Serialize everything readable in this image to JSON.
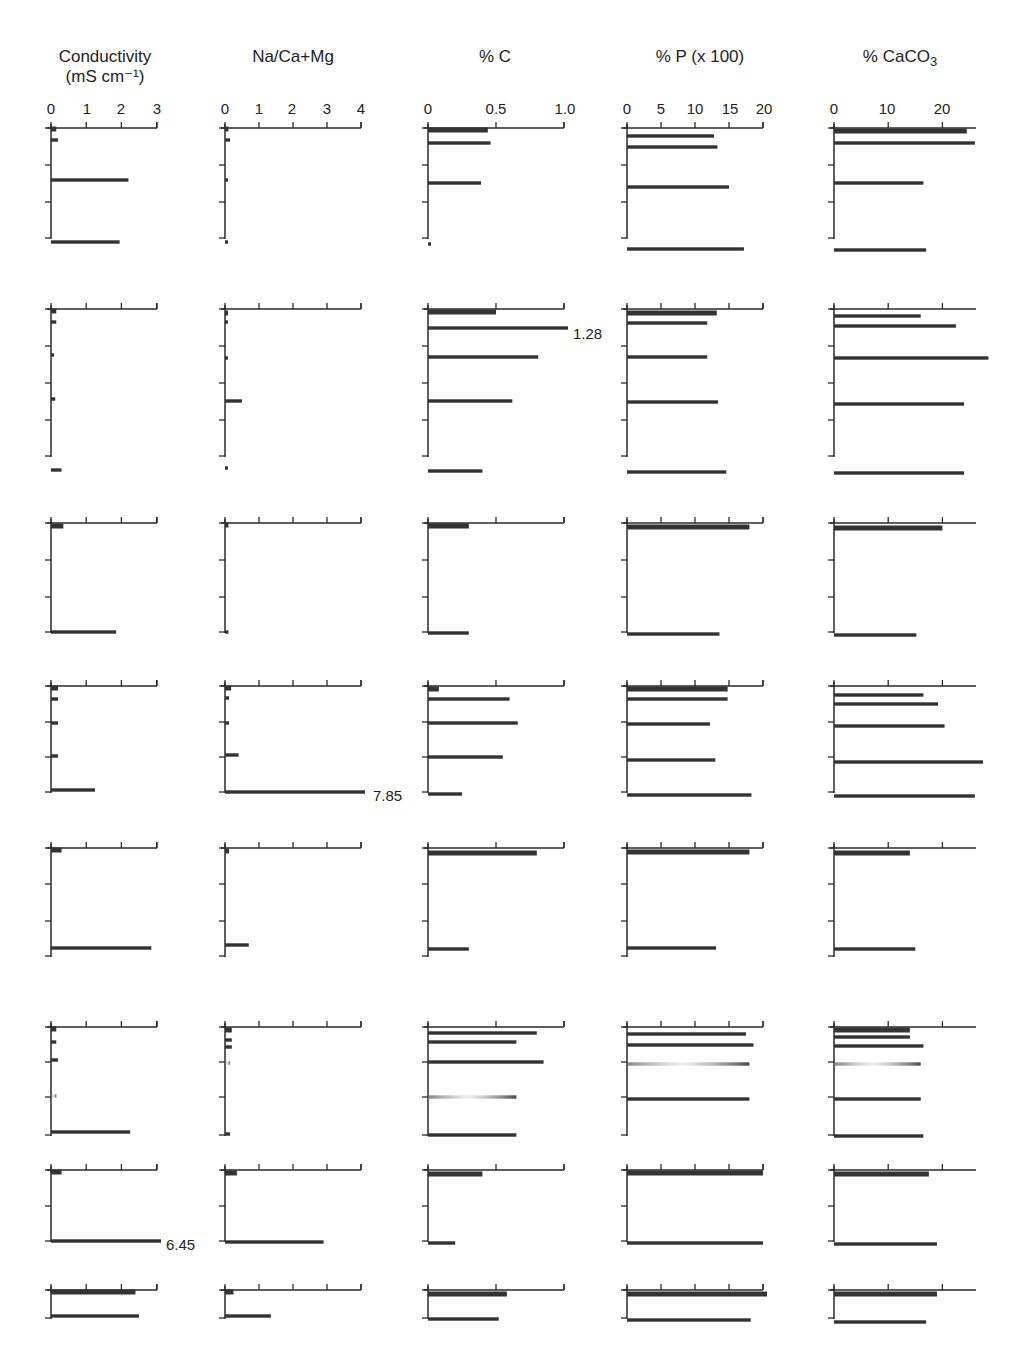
{
  "chart_data": {
    "type": "bar",
    "orientation": "horizontal",
    "title": "",
    "columns": [
      {
        "key": "cond",
        "label": "Conductivity",
        "unit_label": "(mS cm⁻¹)",
        "ticks": [
          "0",
          "1",
          "2",
          "3"
        ],
        "tick_values": [
          0,
          1,
          2,
          3
        ],
        "xlim": [
          0,
          3
        ]
      },
      {
        "key": "na",
        "label": "Na/Ca+Mg",
        "unit_label": "",
        "ticks": [
          "0",
          "1",
          "2",
          "3",
          "4"
        ],
        "tick_values": [
          0,
          1,
          2,
          3,
          4
        ],
        "xlim": [
          0,
          4
        ]
      },
      {
        "key": "c",
        "label": "% C",
        "unit_label": "",
        "ticks": [
          "0",
          "0.5",
          "1.0"
        ],
        "tick_values": [
          0,
          0.5,
          1.0
        ],
        "xlim": [
          0,
          1.0
        ]
      },
      {
        "key": "p",
        "label": "% P (x 100)",
        "unit_label": "",
        "ticks": [
          "0",
          "5",
          "10",
          "15",
          "20"
        ],
        "tick_values": [
          0,
          5,
          10,
          15,
          20
        ],
        "xlim": [
          0,
          20
        ]
      },
      {
        "key": "caco3",
        "label": "% CaCO",
        "label_sub": "3",
        "unit_label": "",
        "ticks": [
          "0",
          "10",
          "20"
        ],
        "tick_values": [
          0,
          10,
          20
        ],
        "xlim": [
          0,
          26
        ]
      }
    ],
    "profiles": [
      {
        "name": "Profile 1",
        "depth_ticks": 4,
        "series": {
          "cond": [
            0.15,
            0.2,
            2.2,
            1.95
          ],
          "na": [
            0.1,
            0.15,
            0.08,
            0.08
          ],
          "c": [
            0.44,
            0.46,
            0.39,
            0.02
          ],
          "p": [
            12.8,
            13.3,
            15.0,
            17.2
          ],
          "caco3": [
            24.5,
            26.0,
            16.5,
            17.0
          ]
        },
        "annotations": []
      },
      {
        "name": "Profile 2",
        "depth_ticks": 6,
        "series": {
          "cond": [
            0.15,
            0.15,
            0.08,
            0.12,
            0.3
          ],
          "na": [
            0.02,
            0.02,
            0.02,
            0.5,
            0.08
          ],
          "c": [
            0.5,
            1.28,
            0.81,
            0.62,
            0.4
          ],
          "p": [
            13.2,
            11.8,
            11.8,
            13.4,
            14.6
          ],
          "caco3": [
            16.0,
            22.5,
            28.5,
            24.0,
            24.0
          ]
        },
        "annotations": [
          {
            "column": "c",
            "bar_index": 1,
            "text": "1.28"
          }
        ]
      },
      {
        "name": "Profile 3",
        "depth_ticks": 3,
        "series": {
          "cond": [
            0.35,
            1.85
          ],
          "na": [
            0.1,
            0.1
          ],
          "c": [
            0.3,
            0.3
          ],
          "p": [
            18.0,
            13.6
          ],
          "caco3": [
            20.0,
            15.2
          ]
        },
        "annotations": []
      },
      {
        "name": "Profile 4",
        "depth_ticks": 4,
        "series": {
          "cond": [
            0.2,
            0.2,
            0.2,
            0.2,
            1.25
          ],
          "na": [
            0.18,
            0.12,
            0.12,
            0.4,
            7.85
          ],
          "c": [
            0.08,
            0.6,
            0.66,
            0.55,
            0.25
          ],
          "p": [
            14.8,
            14.8,
            12.2,
            13.0,
            18.3
          ],
          "caco3": [
            16.5,
            19.2,
            20.4,
            27.5,
            26.0
          ]
        },
        "annotations": [
          {
            "column": "na",
            "bar_index": 4,
            "text": "7.85"
          }
        ]
      },
      {
        "name": "Profile 5",
        "depth_ticks": 3,
        "series": {
          "cond": [
            0.3,
            2.85
          ],
          "na": [
            0.12,
            0.7
          ],
          "c": [
            0.8,
            0.3
          ],
          "p": [
            18.0,
            13.1
          ],
          "caco3": [
            14.0,
            15.0
          ]
        },
        "annotations": []
      },
      {
        "name": "Profile 6",
        "depth_ticks": 3,
        "series": {
          "cond": [
            0.15,
            0.15,
            0.2,
            0.15,
            2.25
          ],
          "na": [
            0.2,
            0.2,
            0.2,
            0.15,
            0.15
          ],
          "c": [
            0.8,
            0.65,
            0.85,
            0.65,
            0.65
          ],
          "p": [
            17.5,
            18.6,
            18.0,
            18.0
          ],
          "caco3": [
            14.0,
            14.0,
            16.5,
            16.0,
            16.0,
            16.5
          ]
        },
        "faded_bars": [
          {
            "column": "cond",
            "bar_index": 3
          },
          {
            "column": "na",
            "bar_index": 3
          },
          {
            "column": "c",
            "bar_index": 3
          },
          {
            "column": "p",
            "bar_index": 2
          },
          {
            "column": "caco3",
            "bar_index": 3
          }
        ],
        "annotations": []
      },
      {
        "name": "Profile 7",
        "depth_ticks": 2,
        "series": {
          "cond": [
            0.3,
            6.45
          ],
          "na": [
            0.35,
            2.9
          ],
          "c": [
            0.4,
            0.2
          ],
          "p": [
            20.0,
            20.0
          ],
          "caco3": [
            17.5,
            19.0
          ]
        },
        "annotations": [
          {
            "column": "cond",
            "bar_index": 1,
            "text": "6.45"
          }
        ]
      },
      {
        "name": "Profile 8",
        "depth_ticks": 1,
        "series": {
          "cond": [
            2.4,
            2.5
          ],
          "na": [
            0.25,
            1.35
          ],
          "c": [
            0.58,
            0.52
          ],
          "p": [
            21.5,
            18.2
          ],
          "caco3": [
            19.0,
            17.0
          ]
        },
        "annotations": []
      }
    ],
    "grid": false,
    "legend": "none"
  },
  "headers": {
    "cond": {
      "line1": "Conductivity",
      "line2": "(mS cm⁻¹)"
    },
    "na": {
      "line1": "Na/Ca+Mg"
    },
    "c": {
      "line1": "% C"
    },
    "p": {
      "line1": "% P (x 100)"
    },
    "caco3": {
      "line1": "% CaCO",
      "sub": "3"
    }
  },
  "ticks": {
    "cond": [
      "0",
      "1",
      "2",
      "3"
    ],
    "na": [
      "0",
      "1",
      "2",
      "3",
      "4"
    ],
    "c": [
      "0",
      "0.5",
      "1.0"
    ],
    "p": [
      "0",
      "5",
      "10",
      "15",
      "20"
    ],
    "caco3": [
      "0",
      "10",
      "20"
    ]
  },
  "annotations": {
    "c_row2": "1.28",
    "na_row4": "7.85",
    "cond_row7": "6.45"
  }
}
